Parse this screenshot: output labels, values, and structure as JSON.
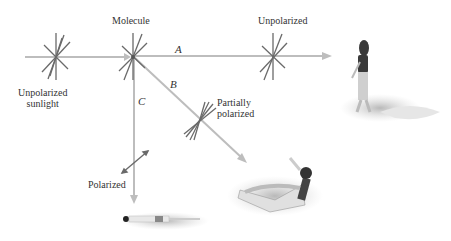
{
  "labels": {
    "molecule": "Molecule",
    "unpolarized_sunlight_line1": "Unpolarized",
    "unpolarized_sunlight_line2": "sunlight",
    "unpolarized": "Unpolarized",
    "partially_line1": "Partially",
    "partially_line2": "polarized",
    "polarized": "Polarized",
    "path_a": "A",
    "path_b": "B",
    "path_c": "C"
  },
  "colors": {
    "ray": "#b8b8b8",
    "star": "#666666",
    "text": "#333333"
  },
  "figures": {
    "walking_person": "person walking on beach",
    "lying_person": "person lying on towel",
    "lounging_person": "person on lounge chair"
  }
}
